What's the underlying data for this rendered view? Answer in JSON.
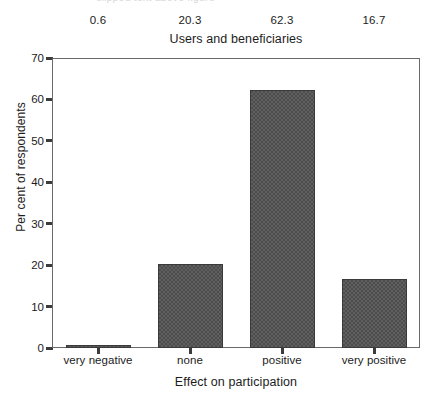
{
  "clipped_caption": "clipped text above figure",
  "chart_data": {
    "type": "bar",
    "title": "Users and beneficiaries",
    "xlabel": "Effect on participation",
    "ylabel": "Per cent of respondents",
    "categories": [
      "very negative",
      "none",
      "positive",
      "very positive"
    ],
    "values": [
      0.6,
      20.3,
      62.3,
      16.7
    ],
    "value_labels": [
      "0.6",
      "20.3",
      "62.3",
      "16.7"
    ],
    "ylim": [
      0,
      70
    ],
    "yticks": [
      0,
      10,
      20,
      30,
      40,
      50,
      60,
      70
    ],
    "ytick_labels": [
      "0",
      "10",
      "20",
      "30",
      "40",
      "50",
      "60",
      "70"
    ],
    "grid": false,
    "legend": "none",
    "bar_color": "#4d4d4d",
    "bar_edge_color": "#3a3a3a",
    "axis_color": "#6a6a6a",
    "background_color": "#ffffff",
    "bar_fill_pattern": "checkerboard-dither"
  }
}
